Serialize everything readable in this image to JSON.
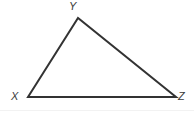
{
  "figure": {
    "kind": "geometry-diagram",
    "shape": "triangle",
    "background_color": "#ffffff",
    "stroke_color": "#333333",
    "stroke_width": 2,
    "label_color": "#3a3a3a",
    "canvas": {
      "width": 194,
      "height": 114
    },
    "vertices": [
      {
        "id": "Y",
        "label": "Y",
        "x": 78,
        "y": 18,
        "label_x": 69,
        "label_y": 1
      },
      {
        "id": "X",
        "label": "X",
        "x": 28,
        "y": 97,
        "label_x": 11,
        "label_y": 91
      },
      {
        "id": "Z",
        "label": "Z",
        "x": 176,
        "y": 97,
        "label_x": 178,
        "label_y": 91
      }
    ],
    "edges": [
      {
        "id": "XY",
        "from": "X",
        "to": "Y"
      },
      {
        "id": "YZ",
        "from": "Y",
        "to": "Z"
      },
      {
        "id": "XZ",
        "from": "X",
        "to": "Z"
      }
    ],
    "polygon_points": "28,97 78,18 176,97"
  }
}
